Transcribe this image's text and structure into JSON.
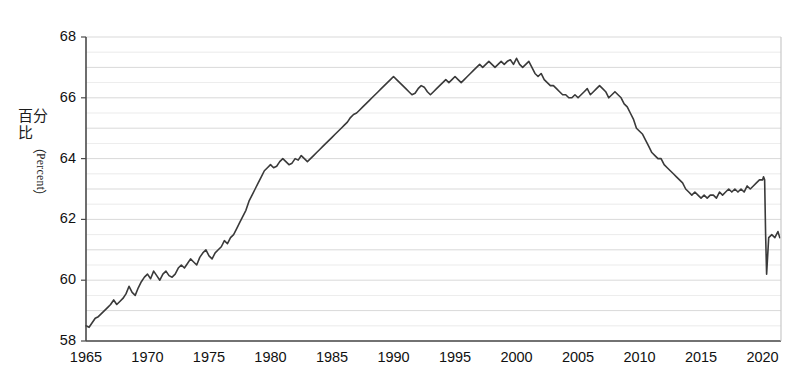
{
  "axes": {
    "y_title_cjk": "百分比",
    "y_title_paren_open": "（",
    "y_title_latin": "Percent",
    "y_title_paren_close": "）",
    "y_ticks": [
      "58",
      "60",
      "62",
      "64",
      "66",
      "68"
    ],
    "x_ticks": [
      "1965",
      "1970",
      "1975",
      "1980",
      "1985",
      "1990",
      "1995",
      "2000",
      "2005",
      "2010",
      "2015",
      "2020"
    ]
  },
  "style": {
    "line_color": "#3a3a3a",
    "grid_color": "#d8d8d8",
    "axis_color": "#4a4a4a",
    "background": "#ffffff"
  },
  "chart_data": {
    "type": "line",
    "title": "",
    "subtitle": "",
    "xlabel": "",
    "ylabel": "百分比（Percent）",
    "xlim": [
      1965,
      2021.5
    ],
    "ylim": [
      58,
      68
    ],
    "grid": true,
    "grid_interval": 0.5,
    "legend": null,
    "x_tick_values": [
      1965,
      1970,
      1975,
      1980,
      1985,
      1990,
      1995,
      2000,
      2005,
      2010,
      2015,
      2020
    ],
    "y_tick_values": [
      58,
      60,
      62,
      64,
      66,
      68
    ],
    "series": [
      {
        "name": "Percent",
        "color": "#3a3a3a",
        "x": [
          1965.0,
          1965.25,
          1965.5,
          1965.75,
          1966.0,
          1966.25,
          1966.5,
          1966.75,
          1967.0,
          1967.25,
          1967.5,
          1967.75,
          1968.0,
          1968.25,
          1968.5,
          1968.75,
          1969.0,
          1969.25,
          1969.5,
          1969.75,
          1970.0,
          1970.25,
          1970.5,
          1970.75,
          1971.0,
          1971.25,
          1971.5,
          1971.75,
          1972.0,
          1972.25,
          1972.5,
          1972.75,
          1973.0,
          1973.25,
          1973.5,
          1973.75,
          1974.0,
          1974.25,
          1974.5,
          1974.75,
          1975.0,
          1975.25,
          1975.5,
          1975.75,
          1976.0,
          1976.25,
          1976.5,
          1976.75,
          1977.0,
          1977.25,
          1977.5,
          1977.75,
          1978.0,
          1978.25,
          1978.5,
          1978.75,
          1979.0,
          1979.25,
          1979.5,
          1979.75,
          1980.0,
          1980.25,
          1980.5,
          1980.75,
          1981.0,
          1981.25,
          1981.5,
          1981.75,
          1982.0,
          1982.25,
          1982.5,
          1982.75,
          1983.0,
          1983.25,
          1983.5,
          1983.75,
          1984.0,
          1984.25,
          1984.5,
          1984.75,
          1985.0,
          1985.25,
          1985.5,
          1985.75,
          1986.0,
          1986.25,
          1986.5,
          1986.75,
          1987.0,
          1987.25,
          1987.5,
          1987.75,
          1988.0,
          1988.25,
          1988.5,
          1988.75,
          1989.0,
          1989.25,
          1989.5,
          1989.75,
          1990.0,
          1990.25,
          1990.5,
          1990.75,
          1991.0,
          1991.25,
          1991.5,
          1991.75,
          1992.0,
          1992.25,
          1992.5,
          1992.75,
          1993.0,
          1993.25,
          1993.5,
          1993.75,
          1994.0,
          1994.25,
          1994.5,
          1994.75,
          1995.0,
          1995.25,
          1995.5,
          1995.75,
          1996.0,
          1996.25,
          1996.5,
          1996.75,
          1997.0,
          1997.25,
          1997.5,
          1997.75,
          1998.0,
          1998.25,
          1998.5,
          1998.75,
          1999.0,
          1999.25,
          1999.5,
          1999.75,
          2000.0,
          2000.25,
          2000.5,
          2000.75,
          2001.0,
          2001.25,
          2001.5,
          2001.75,
          2002.0,
          2002.25,
          2002.5,
          2002.75,
          2003.0,
          2003.25,
          2003.5,
          2003.75,
          2004.0,
          2004.25,
          2004.5,
          2004.75,
          2005.0,
          2005.25,
          2005.5,
          2005.75,
          2006.0,
          2006.25,
          2006.5,
          2006.75,
          2007.0,
          2007.25,
          2007.5,
          2007.75,
          2008.0,
          2008.25,
          2008.5,
          2008.75,
          2009.0,
          2009.25,
          2009.5,
          2009.75,
          2010.0,
          2010.25,
          2010.5,
          2010.75,
          2011.0,
          2011.25,
          2011.5,
          2011.75,
          2012.0,
          2012.25,
          2012.5,
          2012.75,
          2013.0,
          2013.25,
          2013.5,
          2013.75,
          2014.0,
          2014.25,
          2014.5,
          2014.75,
          2015.0,
          2015.25,
          2015.5,
          2015.75,
          2016.0,
          2016.25,
          2016.5,
          2016.75,
          2017.0,
          2017.25,
          2017.5,
          2017.75,
          2018.0,
          2018.25,
          2018.5,
          2018.75,
          2019.0,
          2019.25,
          2019.5,
          2019.75,
          2020.0,
          2020.08,
          2020.17,
          2020.25,
          2020.33,
          2020.5,
          2020.75,
          2021.0,
          2021.25,
          2021.4
        ],
        "y": [
          58.5,
          58.45,
          58.6,
          58.75,
          58.8,
          58.9,
          59.0,
          59.1,
          59.2,
          59.35,
          59.2,
          59.3,
          59.4,
          59.55,
          59.8,
          59.6,
          59.5,
          59.75,
          59.95,
          60.1,
          60.2,
          60.05,
          60.3,
          60.15,
          60.0,
          60.2,
          60.3,
          60.15,
          60.1,
          60.2,
          60.4,
          60.5,
          60.4,
          60.55,
          60.7,
          60.6,
          60.5,
          60.75,
          60.9,
          61.0,
          60.8,
          60.7,
          60.9,
          61.0,
          61.1,
          61.3,
          61.2,
          61.4,
          61.5,
          61.7,
          61.9,
          62.1,
          62.3,
          62.6,
          62.8,
          63.0,
          63.2,
          63.4,
          63.6,
          63.7,
          63.8,
          63.7,
          63.75,
          63.9,
          64.0,
          63.9,
          63.8,
          63.85,
          64.0,
          63.95,
          64.1,
          64.0,
          63.9,
          64.0,
          64.1,
          64.2,
          64.3,
          64.4,
          64.5,
          64.6,
          64.7,
          64.8,
          64.9,
          65.0,
          65.1,
          65.2,
          65.35,
          65.45,
          65.5,
          65.6,
          65.7,
          65.8,
          65.9,
          66.0,
          66.1,
          66.2,
          66.3,
          66.4,
          66.5,
          66.6,
          66.7,
          66.6,
          66.5,
          66.4,
          66.3,
          66.2,
          66.1,
          66.15,
          66.3,
          66.4,
          66.35,
          66.2,
          66.1,
          66.2,
          66.3,
          66.4,
          66.5,
          66.6,
          66.5,
          66.6,
          66.7,
          66.6,
          66.5,
          66.6,
          66.7,
          66.8,
          66.9,
          67.0,
          67.1,
          67.0,
          67.1,
          67.2,
          67.1,
          67.0,
          67.1,
          67.2,
          67.1,
          67.2,
          67.25,
          67.1,
          67.3,
          67.1,
          67.0,
          67.1,
          67.2,
          67.0,
          66.8,
          66.7,
          66.8,
          66.6,
          66.5,
          66.4,
          66.4,
          66.3,
          66.2,
          66.1,
          66.1,
          66.0,
          66.0,
          66.1,
          66.0,
          66.1,
          66.2,
          66.3,
          66.1,
          66.2,
          66.3,
          66.4,
          66.3,
          66.2,
          66.0,
          66.1,
          66.2,
          66.1,
          66.0,
          65.8,
          65.7,
          65.5,
          65.3,
          65.0,
          64.9,
          64.8,
          64.6,
          64.4,
          64.2,
          64.1,
          64.0,
          64.0,
          63.8,
          63.7,
          63.6,
          63.5,
          63.4,
          63.3,
          63.2,
          63.0,
          62.9,
          62.8,
          62.9,
          62.8,
          62.7,
          62.8,
          62.7,
          62.8,
          62.8,
          62.7,
          62.9,
          62.8,
          62.9,
          63.0,
          62.9,
          63.0,
          62.9,
          63.0,
          62.9,
          63.1,
          63.0,
          63.1,
          63.2,
          63.3,
          63.3,
          63.4,
          63.3,
          61.5,
          60.2,
          61.4,
          61.5,
          61.4,
          61.6,
          61.4
        ]
      }
    ],
    "annotations": [
      {
        "text": "COVID-19 sharp drop",
        "x": 2020.25,
        "y": 60.2
      }
    ]
  }
}
